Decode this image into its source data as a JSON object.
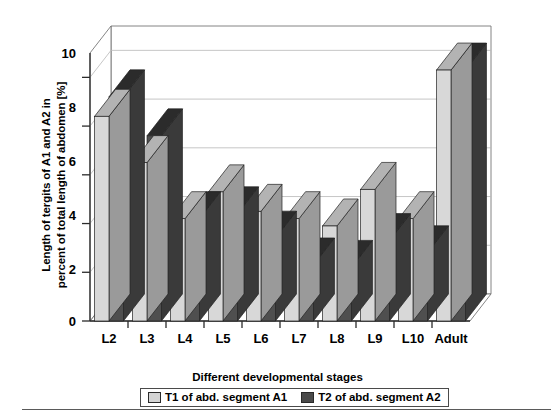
{
  "chart_data": {
    "type": "bar",
    "title": "",
    "xlabel": "Different developmental stages",
    "ylabel": "Length of tergits of A1 and A2 in\npercent of total length of abdomen [%]",
    "categories": [
      "L2",
      "L3",
      "L4",
      "L5",
      "L6",
      "L7",
      "L8",
      "L9",
      "L10",
      "Adult"
    ],
    "series": [
      {
        "name": "T1 of abd. segment A1",
        "color": "#d4d4d4",
        "values": [
          8.4,
          6.5,
          4.2,
          5.3,
          4.5,
          4.2,
          3.9,
          5.4,
          4.2,
          10.3
        ]
      },
      {
        "name": "T2 of abd. segment A2",
        "color": "#4a4a4a",
        "values": [
          9.2,
          7.6,
          4.2,
          4.4,
          3.4,
          2.3,
          2.2,
          3.3,
          2.8,
          10.3
        ]
      }
    ],
    "ylim": [
      0,
      11
    ],
    "yticks": [
      0,
      2,
      4,
      6,
      8,
      10
    ],
    "ytick_labels": [
      "0",
      "2",
      "4",
      "6",
      "8",
      "10"
    ],
    "grid": true,
    "legend_position": "bottom",
    "style_3d": true
  },
  "colors": {
    "bar_light_face": "#d8d8d8",
    "bar_light_top": "#b3b3b3",
    "bar_light_side": "#9a9a9a",
    "bar_dark_face": "#4f4f4f",
    "bar_dark_top": "#2b2b2b",
    "bar_dark_side": "#3a3a3a",
    "axis": "#2b2b2b",
    "grid": "#b8b8b8",
    "background": "#ffffff"
  }
}
